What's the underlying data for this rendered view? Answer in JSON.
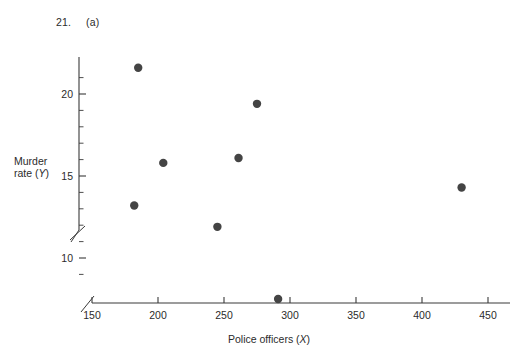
{
  "figure": {
    "number": "21.",
    "part": "(a)"
  },
  "axes": {
    "x_title_text": "Police officers (",
    "x_title_var": "X",
    "x_title_close": ")",
    "y_title_line1": "Murder",
    "y_title_line2_text": "rate (",
    "y_title_var": "Y",
    "y_title_close": ")"
  },
  "chart_data": {
    "type": "scatter",
    "title": "",
    "xlabel": "Police officers (X)",
    "ylabel": "Murder rate (Y)",
    "xlim": [
      150,
      460
    ],
    "ylim": [
      7,
      22.5
    ],
    "x_ticks": [
      150,
      200,
      250,
      300,
      350,
      400,
      450
    ],
    "x_tick_labels": [
      "150",
      "200",
      "250",
      "300",
      "350",
      "400",
      "450"
    ],
    "x_minor_step": 10,
    "y_ticks": [
      10,
      15,
      20
    ],
    "y_tick_labels": [
      "10",
      "15",
      "20"
    ],
    "y_minor_step": 1,
    "grid": false,
    "legend": false,
    "axis_break_x": true,
    "axis_break_y": true,
    "points": [
      {
        "x": 182,
        "y": 13.2
      },
      {
        "x": 185,
        "y": 21.6
      },
      {
        "x": 204,
        "y": 15.8
      },
      {
        "x": 245,
        "y": 11.9
      },
      {
        "x": 261,
        "y": 16.1
      },
      {
        "x": 275,
        "y": 19.4
      },
      {
        "x": 291,
        "y": 7.5
      },
      {
        "x": 430,
        "y": 14.3
      }
    ],
    "marker": {
      "shape": "circle",
      "size": 4.2,
      "color": "#444444"
    }
  }
}
